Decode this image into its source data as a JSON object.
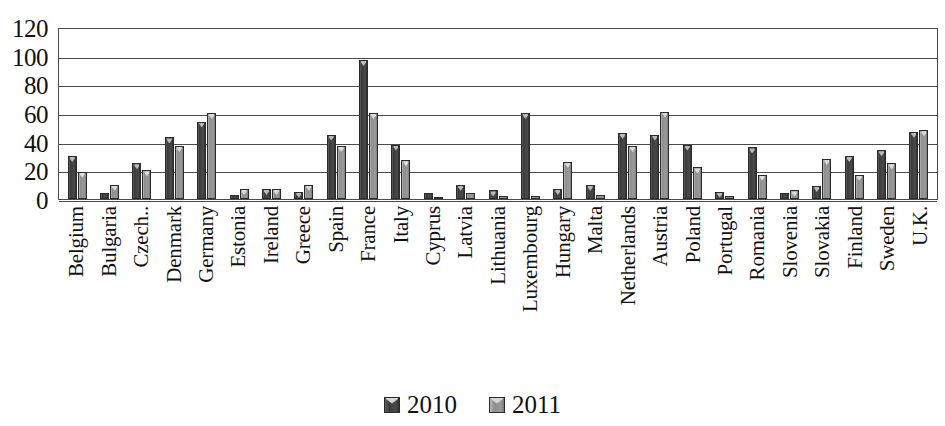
{
  "chart_data": {
    "type": "bar",
    "title": "",
    "xlabel": "",
    "ylabel": "",
    "ylim": [
      0,
      120
    ],
    "ytick_step": 20,
    "yticks": [
      120,
      100,
      80,
      60,
      40,
      20,
      0
    ],
    "grid": true,
    "legend_position": "bottom-center",
    "categories": [
      "Belgium",
      "Bulgaria",
      "Czech..",
      "Denmark",
      "Germany",
      "Estonia",
      "Ireland",
      "Greece",
      "Spain",
      "France",
      "Italy",
      "Cyprus",
      "Latvia",
      "Lithuania",
      "Luxembourg",
      "Hungary",
      "Malta",
      "Netherlands",
      "Austria",
      "Poland",
      "Portugal",
      "Romania",
      "Slovenia",
      "Slovakia",
      "Finland",
      "Sweden",
      "U.K."
    ],
    "series": [
      {
        "name": "2010",
        "color": "#3c3c3c",
        "values": [
          30,
          4,
          25,
          43,
          54,
          3,
          7,
          5,
          45,
          97,
          38,
          4,
          10,
          6,
          60,
          7,
          10,
          46,
          45,
          38,
          5,
          36,
          4,
          9,
          30,
          34,
          47
        ]
      },
      {
        "name": "2011",
        "color": "#9a9a9a",
        "values": [
          19,
          10,
          20,
          37,
          60,
          7,
          7,
          10,
          37,
          60,
          27,
          0,
          4,
          2,
          2,
          26,
          3,
          37,
          61,
          22,
          2,
          17,
          6,
          28,
          17,
          25,
          48
        ]
      }
    ],
    "legend": [
      "2010",
      "2011"
    ]
  },
  "axis": {
    "y_ticks": [
      "120",
      "100",
      "80",
      "60",
      "40",
      "20",
      "0"
    ]
  },
  "legend": {
    "items": [
      {
        "label": "2010"
      },
      {
        "label": "2011"
      }
    ]
  }
}
